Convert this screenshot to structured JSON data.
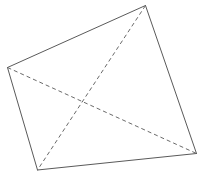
{
  "diagram": {
    "type": "quadrilateral-with-diagonals",
    "vertices": [
      "top-right",
      "right",
      "bottom-left",
      "left"
    ],
    "edges": [
      {
        "from": "left",
        "to": "top-right",
        "style": "solid"
      },
      {
        "from": "top-right",
        "to": "right",
        "style": "solid"
      },
      {
        "from": "right",
        "to": "bottom-left",
        "style": "solid"
      },
      {
        "from": "bottom-left",
        "to": "left",
        "style": "solid"
      }
    ],
    "diagonals": [
      {
        "from": "left",
        "to": "right",
        "style": "dashed"
      },
      {
        "from": "top-right",
        "to": "bottom-left",
        "style": "dashed"
      }
    ],
    "labels": [],
    "colors": {
      "edge": "#5a5a5a",
      "diagonal": "#6a6a6a",
      "background": "#ffffff"
    }
  }
}
